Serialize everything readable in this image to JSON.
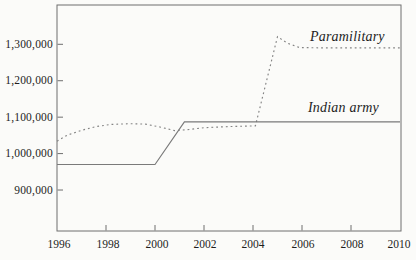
{
  "palette": {
    "background": "#fbfbf9",
    "frame_color": "#6f6f6f",
    "tick_color": "#6f6f6f",
    "solid_line_color": "#7a7a7a",
    "dotted_line_color": "#848484",
    "text_color": "#1e1e1e"
  },
  "chart_data": {
    "type": "line",
    "title": "",
    "xlabel": "",
    "ylabel": "",
    "grid": false,
    "legend_position": "inline-labels",
    "xlim": [
      1996,
      2010
    ],
    "ylim": [
      785000,
      1410000
    ],
    "x_axis": {
      "tick_values": [
        1996,
        1998,
        2000,
        2002,
        2004,
        2006,
        2008,
        2010
      ],
      "tick_labels": [
        "1996",
        "1998",
        "2000",
        "2002",
        "2004",
        "2006",
        "2008",
        "2010"
      ]
    },
    "y_axis": {
      "tick_values": [
        1300000,
        1200000,
        1100000,
        1000000,
        900000
      ],
      "tick_labels": [
        "1,300,000",
        "1,200,000",
        "1,100,000",
        "1,000,000",
        "900,000"
      ]
    },
    "series": [
      {
        "name": "Paramilitary",
        "line_style": "dotted",
        "points": [
          [
            1996,
            1034000
          ],
          [
            1996.4,
            1050000
          ],
          [
            1997,
            1064000
          ],
          [
            1997.6,
            1074000
          ],
          [
            1998.2,
            1080000
          ],
          [
            1999,
            1082000
          ],
          [
            1999.6,
            1081000
          ],
          [
            2000.2,
            1073000
          ],
          [
            2000.8,
            1063000
          ],
          [
            2001.4,
            1066000
          ],
          [
            2002,
            1071000
          ],
          [
            2003,
            1074000
          ],
          [
            2004.1,
            1076000
          ],
          [
            2005,
            1321000
          ],
          [
            2005.4,
            1303000
          ],
          [
            2005.9,
            1291000
          ],
          [
            2007,
            1290000
          ],
          [
            2008.5,
            1290000
          ],
          [
            2010,
            1290000
          ]
        ]
      },
      {
        "name": "Indian army",
        "line_style": "solid",
        "points": [
          [
            1996,
            970000
          ],
          [
            2000,
            970000
          ],
          [
            2001.2,
            1087000
          ],
          [
            2010,
            1087000
          ]
        ]
      }
    ]
  }
}
